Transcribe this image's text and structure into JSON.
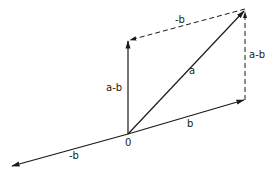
{
  "diagram": {
    "origin_label": "0",
    "labels": {
      "a": "a",
      "b": "b",
      "neg_b_bottom": "-b",
      "neg_b_top": "-b",
      "a_minus_b_left": "a-b",
      "a_minus_b_right": "a-b"
    },
    "points": {
      "origin": [
        128,
        134
      ],
      "a_tip": [
        245,
        9
      ],
      "b_tip": [
        245,
        100
      ],
      "neg_b_tip": [
        11,
        166
      ],
      "a_minus_b_tip": [
        128,
        40
      ]
    },
    "colors": {
      "stroke": "#1a1a1a",
      "background": "#ffffff"
    }
  }
}
